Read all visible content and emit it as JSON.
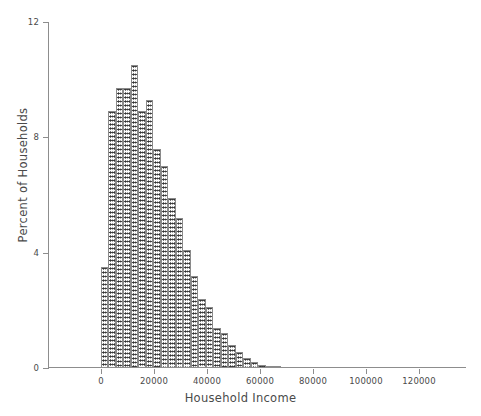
{
  "chart_data": {
    "type": "bar",
    "title": "",
    "subtitle": "",
    "xlabel": "Household Income",
    "ylabel": "Percent of Households",
    "xlim": [
      -6000,
      140000
    ],
    "ylim": [
      0,
      12
    ],
    "grid": false,
    "legend": null,
    "xticks": [
      0,
      20000,
      40000,
      60000,
      80000,
      100000,
      120000
    ],
    "xticklabels": [
      "0",
      "20000",
      "40000",
      "60000",
      "80000",
      "100000",
      "120000"
    ],
    "yticks": [
      0,
      4,
      8,
      12
    ],
    "yticklabels": [
      "0",
      "4",
      "8",
      "12"
    ],
    "bin_width": 2830,
    "note": "Histogram of household income; right-skewed distribution peaking near 12000 at about 10.5 percent.",
    "bin_starts": [
      0,
      2830,
      5660,
      8490,
      11320,
      14150,
      16980,
      19810,
      22640,
      25470,
      28300,
      31130,
      33960,
      36790,
      39620,
      42450,
      45280,
      48110,
      50940,
      53770,
      56600,
      59430,
      62260,
      65090
    ],
    "values": [
      3.5,
      8.9,
      9.7,
      9.7,
      10.5,
      8.9,
      9.3,
      7.6,
      7.0,
      5.9,
      5.2,
      4.1,
      3.2,
      2.4,
      2.1,
      1.4,
      1.2,
      0.8,
      0.55,
      0.35,
      0.2,
      0.12,
      0.07,
      0.04
    ],
    "series": [
      {
        "name": "Percent of Households",
        "values": [
          3.5,
          8.9,
          9.7,
          9.7,
          10.5,
          8.9,
          9.3,
          7.6,
          7.0,
          5.9,
          5.2,
          4.1,
          3.2,
          2.4,
          2.1,
          1.4,
          1.2,
          0.8,
          0.55,
          0.35,
          0.2,
          0.12,
          0.07,
          0.04
        ]
      }
    ],
    "colors": {
      "bar_fill": "#b9b9b9",
      "bar_edge": "#8a8a8a",
      "axis": "#8d8d8d",
      "text": "#4a4a4a",
      "background": "#ffffff"
    }
  }
}
